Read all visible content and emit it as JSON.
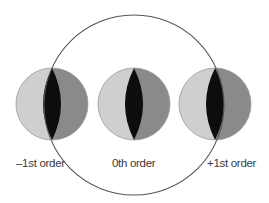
{
  "diagram": {
    "type": "diffraction-orders",
    "big_circle": {
      "cx": 134,
      "cy": 105,
      "r": 90,
      "stroke": "#555555"
    },
    "colors": {
      "light": "#cfcfcf",
      "dark": "#8a8a8a",
      "overlap": "#0d0d0d",
      "outline": "#9a9a9a"
    },
    "orders": [
      {
        "id": "minus-first",
        "label": "–1st order",
        "cx": 52,
        "cy": 104,
        "r": 36,
        "label_x": 16,
        "label_y": 158
      },
      {
        "id": "zeroth",
        "label": "0th order",
        "cx": 134,
        "cy": 104,
        "r": 36,
        "label_x": 112,
        "label_y": 158
      },
      {
        "id": "plus-first",
        "label": "+1st order",
        "cx": 215,
        "cy": 104,
        "r": 36,
        "label_x": 207,
        "label_y": 158
      }
    ]
  }
}
